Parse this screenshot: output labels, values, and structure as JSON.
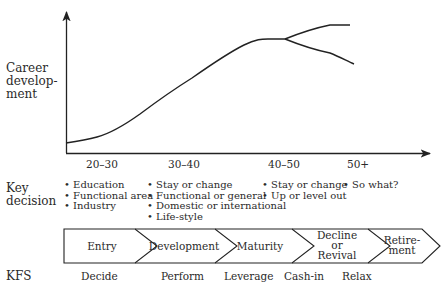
{
  "diagram": {
    "y_axis_label": [
      "Career",
      "develop-",
      "ment"
    ],
    "age_ranges": [
      "20–30",
      "30–40",
      "40–50",
      "50+"
    ],
    "key_decision": {
      "label": [
        "Key",
        "decision"
      ],
      "columns": [
        [
          "• Education",
          "• Functional area",
          "• Industry"
        ],
        [
          "• Stay or change",
          "• Functional or general",
          "• Domestic or international",
          "• Life-style"
        ],
        [
          "• Stay or change",
          "• Up or level out"
        ],
        [
          "• So what?"
        ]
      ]
    },
    "stages": [
      {
        "label": [
          "Entry"
        ]
      },
      {
        "label": [
          "Development"
        ]
      },
      {
        "label": [
          "Maturity"
        ]
      },
      {
        "label": [
          "Decline",
          "or",
          "Revival"
        ]
      },
      {
        "label": [
          "Retire-",
          "ment"
        ]
      }
    ],
    "kfs": {
      "label": "KFS",
      "items": [
        "Decide",
        "Perform",
        "Leverage",
        "Cash-in",
        "Relax"
      ]
    },
    "curve": {
      "description": "S-shaped career development curve rising through 20–30 and 30–40, plateauing around 40–50, then branching into an upward (revival) and downward (decline) path at 50+",
      "branches": [
        "revival",
        "decline"
      ]
    },
    "colors": {
      "ink": "#222222",
      "background": "#ffffff"
    }
  }
}
